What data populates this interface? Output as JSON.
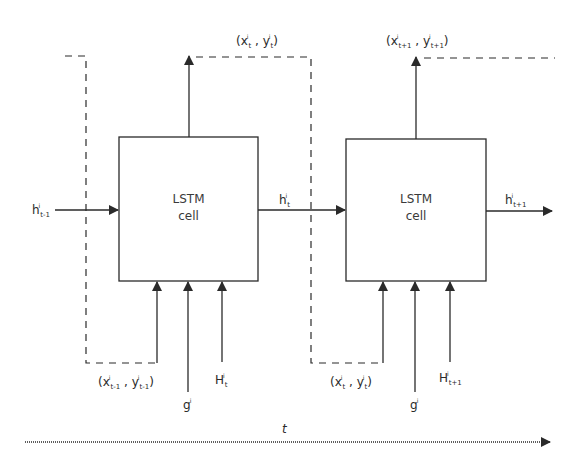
{
  "diagram": {
    "type": "lstm-unrolled-timestep",
    "cells": [
      {
        "line1": "LSTM",
        "line2": "cell"
      },
      {
        "line1": "LSTM",
        "line2": "cell"
      }
    ],
    "labels": {
      "h_prev": {
        "base": "h",
        "sup": "i",
        "sub": "t-1"
      },
      "h_mid": {
        "base": "h",
        "sup": "i",
        "sub": "t"
      },
      "h_next": {
        "base": "h",
        "sup": "i",
        "sub": "t+1"
      },
      "out1": {
        "open": "(",
        "x": "x",
        "xsup": "i",
        "xsub": "t",
        "sep": " , ",
        "y": "y",
        "ysup": "i",
        "ysub": "t",
        "close": ")"
      },
      "out2": {
        "open": "(",
        "x": "x",
        "xsup": "i",
        "xsub": "t+1",
        "sep": " , ",
        "y": "y",
        "ysup": "i",
        "ysub": "t+1",
        "close": ")"
      },
      "in1": {
        "open": "(",
        "x": "x",
        "xsup": "i",
        "xsub": "t-1",
        "sep": " , ",
        "y": "y",
        "ysup": "i",
        "ysub": "t-1",
        "close": ")"
      },
      "in2": {
        "open": "(",
        "x": "x",
        "xsup": "i",
        "xsub": "t",
        "sep": " , ",
        "y": "y",
        "ysup": "i",
        "ysub": "t",
        "close": ")"
      },
      "g1": {
        "base": "g",
        "sup": "i"
      },
      "g2": {
        "base": "g",
        "sup": "i"
      },
      "H1": {
        "base": "H",
        "sup": "i",
        "sub": "t"
      },
      "H2": {
        "base": "H",
        "sup": "i",
        "sub": "t+1"
      }
    },
    "time_axis": {
      "label": "t"
    },
    "colors": {
      "stroke": "#2a2a2a",
      "background": "#ffffff"
    }
  }
}
